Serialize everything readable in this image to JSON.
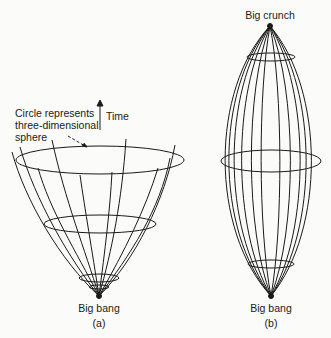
{
  "diagram": {
    "panel_a": {
      "caption": "(a)",
      "bottom_label": "Big bang",
      "annotation": [
        "Circle represents",
        "three-dimensional",
        "sphere"
      ],
      "time_label": "Time"
    },
    "panel_b": {
      "caption": "(b)",
      "top_label": "Big crunch",
      "bottom_label": "Big bang"
    },
    "colors": {
      "background": "#fbfbf9",
      "ink": "#1a1a1a"
    }
  }
}
